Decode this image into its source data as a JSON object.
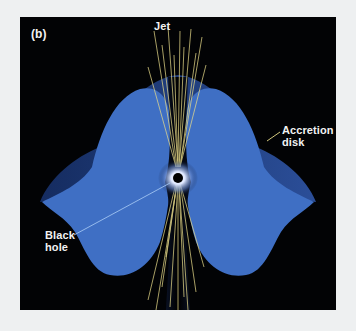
{
  "figure": {
    "panel_label": "(b)",
    "labels": {
      "jet": "Jet",
      "accretion_disk_line1": "Accretion",
      "accretion_disk_line2": "disk",
      "black_hole_line1": "Black",
      "black_hole_line2": "hole"
    },
    "colors": {
      "background": "#020305",
      "disk_face": "#3f6fc4",
      "disk_rim": "#1d3a78",
      "jet_lines": "#e8dc8a",
      "label_text": "#f2f2f2",
      "leader_line": "#9fc3f0"
    }
  }
}
